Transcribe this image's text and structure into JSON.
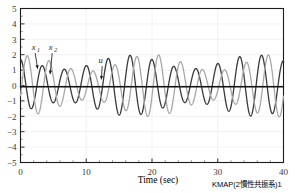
{
  "chart_data": {
    "type": "line",
    "title": "",
    "xlabel": "Time (sec)",
    "ylabel": "",
    "xlim": [
      0,
      40
    ],
    "ylim": [
      -5,
      5
    ],
    "xticks": [
      0,
      10,
      20,
      30,
      40
    ],
    "yticks": [
      5,
      4,
      3,
      2,
      1,
      0,
      -1,
      -2,
      -3,
      -4,
      -5
    ],
    "xtick_labels": [
      "0",
      "10",
      "20",
      "30",
      "40"
    ],
    "ytick_labels": [
      "5",
      "4",
      "3",
      "2",
      "1",
      "0",
      "−1",
      "−2",
      "−3",
      "−4",
      "−5"
    ],
    "grid": true,
    "legend": "inline-annotations",
    "annotations": [
      {
        "name": "x1",
        "text": "x",
        "sub": "1",
        "label_x": 2.0,
        "label_y": 2.3,
        "arrow_to_x": 2.6,
        "arrow_to_y": 0.95
      },
      {
        "name": "x2",
        "text": "x",
        "sub": "2",
        "label_x": 4.6,
        "label_y": 2.3,
        "arrow_to_x": 4.5,
        "arrow_to_y": 0.6
      },
      {
        "name": "u",
        "text": "u",
        "sub": "",
        "label_x": 12.2,
        "label_y": 1.45,
        "arrow_to_x": 12.3,
        "arrow_to_y": 0.25
      }
    ],
    "series": [
      {
        "name": "x1",
        "color": "#3a3a3a",
        "linewidth": 1.3,
        "description": "Two-inertia resonant response, beating oscillation, amplitude 1 to 2",
        "params": {
          "carrier_freq_hz": 0.3,
          "beat_freq_hz": 0.052,
          "amp_mean": 1.55,
          "amp_mod": 0.45,
          "phase": 1.57
        }
      },
      {
        "name": "x2",
        "color": "#a8a8a8",
        "linewidth": 1.3,
        "description": "Second inertia response, phase shifted beating oscillation",
        "params": {
          "carrier_freq_hz": 0.3,
          "beat_freq_hz": 0.052,
          "amp_mean": 1.5,
          "amp_mod": 0.55,
          "phase": -0.35
        }
      },
      {
        "name": "u",
        "color": "#111111",
        "linewidth": 1.6,
        "description": "Control input, near-zero flat line at 0",
        "params": {
          "constant": -0.08
        }
      }
    ]
  },
  "caption": {
    "bottom_right": "KMAP(2慣性共振系)1"
  },
  "axis": {
    "x_title": "Time (sec)"
  },
  "colors": {
    "frame": "#1a1a1a",
    "grid": "#e8e8ee",
    "series_x1": "#3a3a3a",
    "series_x2": "#a8a8a8",
    "series_u": "#111111",
    "text": "#3a3a3a"
  }
}
